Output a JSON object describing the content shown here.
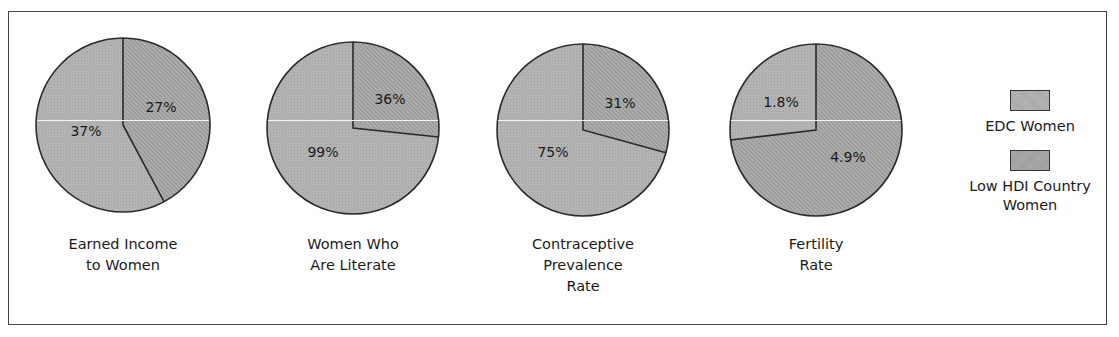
{
  "chart_data": {
    "type": "pie",
    "title": "",
    "legend": {
      "position": "right",
      "entries": [
        {
          "name": "EDC Women",
          "color": "#b0b0b0",
          "pattern": "dotted"
        },
        {
          "name": "Low HDI Country Women",
          "color": "#a3a3a3",
          "pattern": "hatched"
        }
      ]
    },
    "charts": [
      {
        "label": "Earned Income to Women",
        "label_lines": [
          "Earned Income",
          "to Women"
        ],
        "slices": [
          {
            "series": "Low HDI Country Women",
            "value": 27,
            "display": "27%"
          },
          {
            "series": "EDC Women",
            "value": 37,
            "display": "37%"
          }
        ]
      },
      {
        "label": "Women Who Are Literate",
        "label_lines": [
          "Women Who",
          "Are Literate"
        ],
        "slices": [
          {
            "series": "Low HDI Country Women",
            "value": 36,
            "display": "36%"
          },
          {
            "series": "EDC Women",
            "value": 99,
            "display": "99%"
          }
        ]
      },
      {
        "label": "Contraceptive Prevalence Rate",
        "label_lines": [
          "Contraceptive",
          "Prevalence",
          "Rate"
        ],
        "slices": [
          {
            "series": "Low HDI Country Women",
            "value": 31,
            "display": "31%"
          },
          {
            "series": "EDC Women",
            "value": 75,
            "display": "75%"
          }
        ]
      },
      {
        "label": "Fertility Rate",
        "label_lines": [
          "Fertility",
          "Rate"
        ],
        "slices": [
          {
            "series": "Low HDI Country Women",
            "value": 4.9,
            "display": "4.9%"
          },
          {
            "series": "EDC Women",
            "value": 1.8,
            "display": "1.8%"
          }
        ]
      }
    ]
  },
  "pies": [
    {
      "cx": 123,
      "cy": 125,
      "r": 87,
      "small_series": "Low HDI Country Women",
      "small_value": 27,
      "total": 64,
      "small_label": "27%",
      "big_label": "37%",
      "small_direction": "clockwise",
      "small_label_pos": [
        161,
        112
      ],
      "big_label_pos": [
        86,
        136
      ]
    },
    {
      "cx": 353,
      "cy": 128,
      "r": 86,
      "small_series": "Low HDI Country Women",
      "small_value": 36,
      "total": 135,
      "small_label": "36%",
      "big_label": "99%",
      "small_direction": "clockwise",
      "small_label_pos": [
        390,
        104
      ],
      "big_label_pos": [
        323,
        157
      ]
    },
    {
      "cx": 583,
      "cy": 130,
      "r": 86,
      "small_series": "Low HDI Country Women",
      "small_value": 31,
      "total": 106,
      "small_label": "31%",
      "big_label": "75%",
      "small_direction": "clockwise",
      "small_label_pos": [
        620,
        108
      ],
      "big_label_pos": [
        553,
        157
      ]
    },
    {
      "cx": 816,
      "cy": 130,
      "r": 86,
      "small_series": "EDC Women",
      "small_value": 1.8,
      "total": 6.7,
      "small_label": "1.8%",
      "big_label": "4.9%",
      "small_direction": "counterclockwise",
      "small_label_pos": [
        781,
        107
      ],
      "big_label_pos": [
        848,
        162
      ]
    }
  ],
  "pie_labels": [
    [
      "Earned Income",
      "to Women"
    ],
    [
      "Women Who",
      "Are Literate"
    ],
    [
      "Contraceptive",
      "Prevalence",
      "Rate"
    ],
    [
      "Fertility",
      "Rate"
    ]
  ],
  "legend": {
    "items": [
      {
        "label_lines": [
          "EDC Women"
        ]
      },
      {
        "label_lines": [
          "Low HDI Country",
          "Women"
        ]
      }
    ]
  },
  "colors": {
    "edc_fill": "#b0b0b0",
    "low_hdi_fill": "#a3a3a3",
    "stroke": "#2a2a2a",
    "frame": "#444444"
  }
}
